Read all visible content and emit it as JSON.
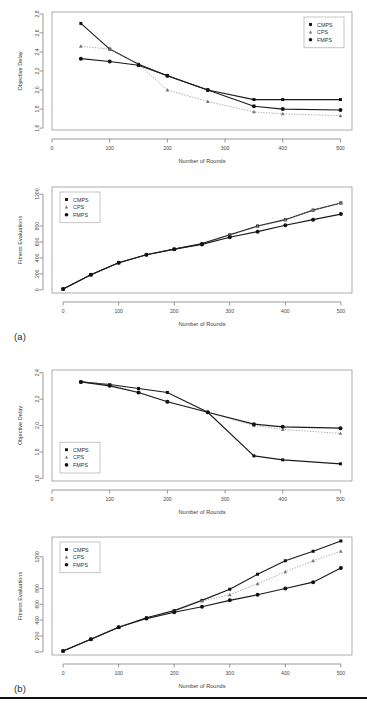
{
  "figure": {
    "panel_a_label": "(a)",
    "panel_b_label": "(b)",
    "caption": ""
  },
  "series_names": {
    "cmps": "CMPS",
    "cps": "CPS",
    "fmps": "FMPS"
  },
  "axis_titles": {
    "rounds": "Number of Rounds",
    "delay": "Objective Delay",
    "fitness": "Fitness Evaluations"
  },
  "chart_data": [
    {
      "id": "chart-a-delay",
      "type": "line",
      "title": "",
      "xlabel": "Number of Rounds",
      "ylabel": "Objective Delay",
      "xlim": [
        0,
        520
      ],
      "ylim": [
        1.58,
        2.82
      ],
      "xticks": [
        0,
        100,
        200,
        300,
        400,
        500
      ],
      "xticklabels": [
        "0",
        "100",
        "200",
        "300",
        "400",
        "500"
      ],
      "yticks": [
        1.6,
        1.8,
        2.0,
        2.2,
        2.4,
        2.6,
        2.8
      ],
      "yticklabels": [
        "1.6",
        "1.8",
        "2.0",
        "2.2",
        "2.4",
        "2.6",
        "2.8"
      ],
      "grid": false,
      "legend_position": "top-right",
      "series": [
        {
          "name": "CMPS",
          "marker": "square",
          "linestyle": "solid",
          "x": [
            50,
            100,
            150,
            200,
            270,
            350,
            400,
            500
          ],
          "values": [
            2.7,
            2.43,
            2.27,
            2.15,
            2.0,
            1.9,
            1.9,
            1.9
          ]
        },
        {
          "name": "CPS",
          "marker": "triangle",
          "linestyle": "dotted",
          "x": [
            50,
            100,
            150,
            200,
            270,
            350,
            400,
            500
          ],
          "values": [
            2.46,
            2.43,
            2.27,
            2.0,
            1.88,
            1.77,
            1.75,
            1.73
          ]
        },
        {
          "name": "FMPS",
          "marker": "circle",
          "linestyle": "solid",
          "x": [
            50,
            100,
            150,
            200,
            270,
            350,
            400,
            500
          ],
          "values": [
            2.33,
            2.3,
            2.26,
            2.15,
            2.0,
            1.83,
            1.8,
            1.79
          ]
        }
      ]
    },
    {
      "id": "chart-a-fitness",
      "type": "line",
      "title": "",
      "xlabel": "Number of Rounds",
      "ylabel": "Fitness Evaluations",
      "xlim": [
        -20,
        520
      ],
      "ylim": [
        -40,
        1290
      ],
      "xticks": [
        0,
        100,
        200,
        300,
        400,
        500
      ],
      "xticklabels": [
        "0",
        "100",
        "200",
        "300",
        "400",
        "500"
      ],
      "yticks": [
        0,
        200,
        400,
        600,
        800,
        1200
      ],
      "yticklabels": [
        "0",
        "200",
        "400",
        "600",
        "800",
        "1200"
      ],
      "grid": false,
      "legend_position": "top-left",
      "series": [
        {
          "name": "CMPS",
          "marker": "square",
          "linestyle": "solid",
          "x": [
            0,
            50,
            100,
            150,
            200,
            250,
            300,
            350,
            400,
            450,
            500
          ],
          "values": [
            10,
            190,
            340,
            440,
            510,
            580,
            690,
            800,
            880,
            1000,
            1090
          ]
        },
        {
          "name": "CPS",
          "marker": "triangle",
          "linestyle": "dotted",
          "x": [
            0,
            50,
            100,
            150,
            200,
            250,
            300,
            350,
            400,
            450,
            500
          ],
          "values": [
            10,
            185,
            340,
            440,
            510,
            575,
            680,
            795,
            875,
            1000,
            1090
          ]
        },
        {
          "name": "FMPS",
          "marker": "circle",
          "linestyle": "solid",
          "x": [
            0,
            50,
            100,
            150,
            200,
            250,
            300,
            350,
            400,
            450,
            500
          ],
          "values": [
            10,
            190,
            340,
            440,
            510,
            570,
            660,
            730,
            810,
            880,
            950
          ]
        }
      ]
    },
    {
      "id": "chart-b-delay",
      "type": "line",
      "title": "",
      "xlabel": "Number of Rounds",
      "ylabel": "Objective Delay",
      "xlim": [
        0,
        520
      ],
      "ylim": [
        1.58,
        2.42
      ],
      "xticks": [
        0,
        100,
        200,
        300,
        400,
        500
      ],
      "xticklabels": [
        "0",
        "100",
        "200",
        "300",
        "400",
        "500"
      ],
      "yticks": [
        1.6,
        1.8,
        2.0,
        2.2,
        2.4
      ],
      "yticklabels": [
        "1.6",
        "1.8",
        "2.0",
        "2.2",
        "2.4"
      ],
      "grid": false,
      "legend_position": "bottom-left",
      "series": [
        {
          "name": "CMPS",
          "marker": "square",
          "linestyle": "solid",
          "x": [
            50,
            100,
            150,
            200,
            270,
            350,
            400,
            500
          ],
          "values": [
            2.33,
            2.31,
            2.28,
            2.25,
            2.1,
            1.77,
            1.74,
            1.71
          ]
        },
        {
          "name": "CPS",
          "marker": "triangle",
          "linestyle": "dotted",
          "x": [
            50,
            100,
            150,
            200,
            270,
            350,
            400,
            500
          ],
          "values": [
            2.33,
            2.31,
            2.25,
            2.18,
            2.1,
            2.0,
            1.97,
            1.94
          ]
        },
        {
          "name": "FMPS",
          "marker": "circle",
          "linestyle": "solid",
          "x": [
            50,
            100,
            150,
            200,
            270,
            350,
            400,
            500
          ],
          "values": [
            2.33,
            2.3,
            2.25,
            2.18,
            2.1,
            2.01,
            1.99,
            1.98
          ]
        }
      ]
    },
    {
      "id": "chart-b-fitness",
      "type": "line",
      "title": "",
      "xlabel": "Number of Rounds",
      "ylabel": "Fitness Evaluations",
      "xlim": [
        -20,
        520
      ],
      "ylim": [
        -40,
        1450
      ],
      "xticks": [
        0,
        100,
        200,
        300,
        400,
        500
      ],
      "xticklabels": [
        "0",
        "100",
        "200",
        "300",
        "400",
        "500"
      ],
      "yticks": [
        0,
        200,
        400,
        600,
        800,
        1200
      ],
      "yticklabels": [
        "0",
        "200",
        "400",
        "600",
        "800",
        "1200"
      ],
      "grid": false,
      "legend_position": "top-left",
      "series": [
        {
          "name": "CMPS",
          "marker": "square",
          "linestyle": "solid",
          "x": [
            0,
            50,
            100,
            150,
            200,
            250,
            300,
            350,
            400,
            450,
            500
          ],
          "values": [
            10,
            160,
            310,
            430,
            520,
            650,
            790,
            980,
            1150,
            1270,
            1400
          ]
        },
        {
          "name": "CPS",
          "marker": "triangle",
          "linestyle": "dotted",
          "x": [
            0,
            50,
            100,
            150,
            200,
            250,
            300,
            350,
            400,
            450,
            500
          ],
          "values": [
            10,
            160,
            310,
            420,
            505,
            640,
            720,
            860,
            1010,
            1150,
            1270
          ]
        },
        {
          "name": "FMPS",
          "marker": "circle",
          "linestyle": "solid",
          "x": [
            0,
            50,
            100,
            150,
            200,
            250,
            300,
            350,
            400,
            450,
            500
          ],
          "values": [
            10,
            160,
            310,
            420,
            500,
            570,
            650,
            720,
            800,
            880,
            1060
          ]
        }
      ]
    }
  ]
}
